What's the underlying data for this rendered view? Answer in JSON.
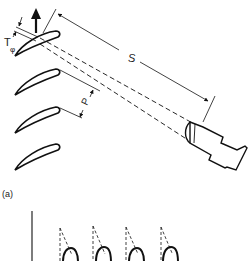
{
  "diagram": {
    "panel_a": {
      "label": "(a)",
      "dimensions": {
        "spacing_label": "S",
        "pitch_label": "P",
        "thickness_label": "T",
        "thickness_subscript": "φ"
      },
      "components": [
        "blade-row",
        "probe",
        "beam-lines",
        "rotation-arrow"
      ],
      "blade_count": 4
    },
    "panel_b": {
      "visible_blade_count": 4,
      "components": [
        "reference-line",
        "blade-profiles",
        "beam-cones"
      ]
    },
    "colors": {
      "stroke": "#111111",
      "background": "#ffffff"
    }
  }
}
